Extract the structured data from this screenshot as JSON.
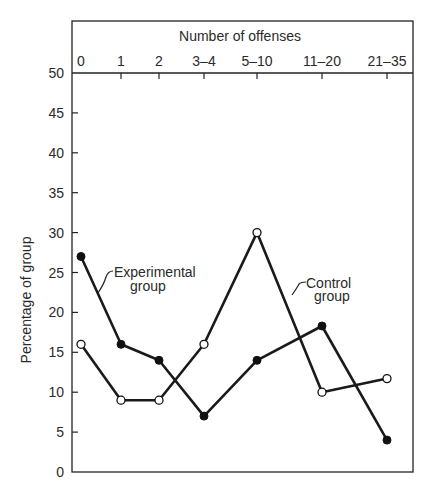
{
  "chart_data": {
    "type": "line",
    "title": "Number of offenses",
    "xlabel": "Number of offenses",
    "ylabel": "Percentage of group",
    "categories": [
      "0",
      "1",
      "2",
      "3-4",
      "5-10",
      "11-20",
      "21-35"
    ],
    "ylim": [
      0,
      50
    ],
    "yticks": [
      0,
      5,
      10,
      15,
      20,
      25,
      30,
      35,
      40,
      45,
      50
    ],
    "x_axis_position": "top",
    "grid": false,
    "legend_position": "inline annotations",
    "series": [
      {
        "name": "Experimental group",
        "marker": "filled-circle",
        "values": [
          27,
          16,
          14,
          7,
          14,
          18.3,
          4
        ]
      },
      {
        "name": "Control group",
        "marker": "open-circle",
        "values": [
          16,
          9,
          9,
          16,
          30,
          10,
          11.7
        ]
      }
    ],
    "annotations": [
      {
        "text": [
          "Experimental",
          "group"
        ],
        "series": "Experimental group"
      },
      {
        "text": [
          "Control",
          "group"
        ],
        "series": "Control group"
      }
    ]
  },
  "labels": {
    "x_title": "Number of offenses",
    "y_title": "Percentage of group",
    "experimental_line1": "Experimental",
    "experimental_line2": "group",
    "control_line1": "Control",
    "control_line2": "group"
  },
  "colors": {
    "line": "#1a1a1a",
    "frame": "#222222",
    "background": "#ffffff"
  }
}
